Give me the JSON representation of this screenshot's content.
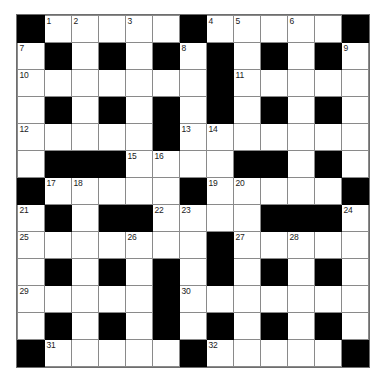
{
  "puzzle": {
    "kind": "crossword-grid",
    "rows": 13,
    "columns": 13,
    "cell_size_px": 26,
    "colors": {
      "block": "#000000",
      "cell": "#ffffff",
      "grid_line": "#8a8a8a",
      "outer_border": "#6e6e6e",
      "number_text": "#1a1a1a",
      "page_background": "#ffffff"
    },
    "highest_number": 32,
    "numbers_present": [
      1,
      2,
      3,
      4,
      5,
      6,
      7,
      8,
      9,
      10,
      11,
      12,
      13,
      14,
      15,
      16,
      17,
      18,
      19,
      20,
      21,
      22,
      23,
      24,
      25,
      26,
      27,
      28,
      29,
      30,
      31,
      32
    ],
    "grid": [
      [
        "B",
        "W",
        "W",
        "W",
        "W",
        "W",
        "B",
        "W",
        "W",
        "W",
        "W",
        "W",
        "B"
      ],
      [
        "W",
        "B",
        "W",
        "B",
        "W",
        "B",
        "W",
        "B",
        "W",
        "B",
        "W",
        "B",
        "W"
      ],
      [
        "W",
        "W",
        "W",
        "W",
        "W",
        "W",
        "W",
        "B",
        "W",
        "W",
        "W",
        "W",
        "W"
      ],
      [
        "W",
        "B",
        "W",
        "B",
        "W",
        "B",
        "W",
        "B",
        "W",
        "B",
        "W",
        "B",
        "W"
      ],
      [
        "W",
        "W",
        "W",
        "W",
        "W",
        "B",
        "W",
        "W",
        "W",
        "W",
        "W",
        "W",
        "W"
      ],
      [
        "W",
        "B",
        "B",
        "B",
        "W",
        "W",
        "W",
        "W",
        "B",
        "B",
        "W",
        "B",
        "W"
      ],
      [
        "B",
        "W",
        "W",
        "W",
        "W",
        "W",
        "B",
        "W",
        "W",
        "W",
        "W",
        "W",
        "B"
      ],
      [
        "W",
        "B",
        "W",
        "B",
        "B",
        "W",
        "W",
        "W",
        "W",
        "B",
        "B",
        "B",
        "W"
      ],
      [
        "W",
        "W",
        "W",
        "W",
        "W",
        "W",
        "W",
        "B",
        "W",
        "W",
        "W",
        "W",
        "W"
      ],
      [
        "W",
        "B",
        "W",
        "B",
        "W",
        "B",
        "W",
        "B",
        "W",
        "B",
        "W",
        "B",
        "W"
      ],
      [
        "W",
        "W",
        "W",
        "W",
        "W",
        "B",
        "W",
        "W",
        "W",
        "W",
        "W",
        "W",
        "W"
      ],
      [
        "W",
        "B",
        "W",
        "B",
        "W",
        "B",
        "W",
        "B",
        "W",
        "B",
        "W",
        "B",
        "W"
      ],
      [
        "B",
        "W",
        "W",
        "W",
        "W",
        "W",
        "B",
        "W",
        "W",
        "W",
        "W",
        "W",
        "B"
      ]
    ],
    "numbers": [
      [
        null,
        "1",
        "2",
        null,
        "3",
        null,
        null,
        "4",
        "5",
        null,
        "6",
        null,
        null
      ],
      [
        "7",
        null,
        null,
        null,
        null,
        null,
        "8",
        null,
        null,
        null,
        null,
        null,
        "9"
      ],
      [
        "10",
        null,
        null,
        null,
        null,
        null,
        null,
        null,
        "11",
        null,
        null,
        null,
        null
      ],
      [
        null,
        null,
        null,
        null,
        null,
        null,
        null,
        null,
        null,
        null,
        null,
        null,
        null
      ],
      [
        "12",
        null,
        null,
        null,
        null,
        null,
        "13",
        "14",
        null,
        null,
        null,
        null,
        null
      ],
      [
        null,
        null,
        null,
        null,
        "15",
        "16",
        null,
        null,
        null,
        null,
        null,
        null,
        null
      ],
      [
        null,
        "17",
        "18",
        null,
        null,
        null,
        null,
        "19",
        "20",
        null,
        null,
        null,
        null
      ],
      [
        "21",
        null,
        null,
        null,
        null,
        "22",
        "23",
        null,
        null,
        null,
        null,
        null,
        "24"
      ],
      [
        "25",
        null,
        null,
        null,
        "26",
        null,
        null,
        null,
        "27",
        null,
        "28",
        null,
        null
      ],
      [
        null,
        null,
        null,
        null,
        null,
        null,
        null,
        null,
        null,
        null,
        null,
        null,
        null
      ],
      [
        "29",
        null,
        null,
        null,
        null,
        null,
        "30",
        null,
        null,
        null,
        null,
        null,
        null
      ],
      [
        null,
        null,
        null,
        null,
        null,
        null,
        null,
        null,
        null,
        null,
        null,
        null,
        null
      ],
      [
        null,
        "31",
        null,
        null,
        null,
        null,
        null,
        "32",
        null,
        null,
        null,
        null,
        null
      ]
    ],
    "letters": [
      [
        null,
        null,
        null,
        null,
        null,
        null,
        null,
        null,
        null,
        null,
        null,
        null,
        null
      ],
      [
        null,
        null,
        null,
        null,
        null,
        null,
        null,
        null,
        null,
        null,
        null,
        null,
        null
      ],
      [
        null,
        null,
        null,
        null,
        null,
        null,
        null,
        null,
        null,
        null,
        null,
        null,
        null
      ],
      [
        null,
        null,
        null,
        null,
        null,
        null,
        null,
        null,
        null,
        null,
        null,
        null,
        null
      ],
      [
        null,
        null,
        null,
        null,
        null,
        null,
        null,
        null,
        null,
        null,
        null,
        null,
        null
      ],
      [
        null,
        null,
        null,
        null,
        null,
        null,
        null,
        null,
        null,
        null,
        null,
        null,
        null
      ],
      [
        null,
        null,
        null,
        null,
        null,
        null,
        null,
        null,
        null,
        null,
        null,
        null,
        null
      ],
      [
        null,
        null,
        null,
        null,
        null,
        null,
        null,
        null,
        null,
        null,
        null,
        null,
        null
      ],
      [
        null,
        null,
        null,
        null,
        null,
        null,
        null,
        null,
        null,
        null,
        null,
        null,
        null
      ],
      [
        null,
        null,
        null,
        null,
        null,
        null,
        null,
        null,
        null,
        null,
        null,
        null,
        null
      ],
      [
        null,
        null,
        null,
        null,
        null,
        null,
        null,
        null,
        null,
        null,
        null,
        null,
        null
      ],
      [
        null,
        null,
        null,
        null,
        null,
        null,
        null,
        null,
        null,
        null,
        null,
        null,
        null
      ],
      [
        null,
        null,
        null,
        null,
        null,
        null,
        null,
        null,
        null,
        null,
        null,
        null,
        null
      ]
    ]
  }
}
